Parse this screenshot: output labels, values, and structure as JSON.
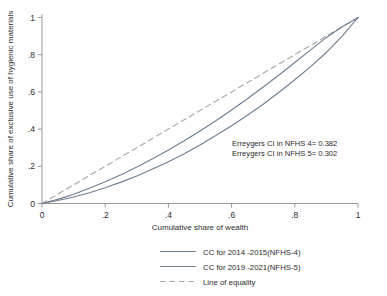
{
  "chart_data": {
    "type": "line",
    "title": "",
    "xlabel": "Cumulative share of wealth",
    "ylabel": "Cumulative share of exclusive use of hygienic materials",
    "xlim": [
      0,
      1
    ],
    "ylim": [
      0,
      1
    ],
    "grid": false,
    "legend_position": "bottom-center",
    "xticks": [
      "0",
      ".2",
      ".4",
      ".6",
      ".8",
      "1"
    ],
    "xtick_values": [
      0,
      0.2,
      0.4,
      0.6,
      0.8,
      1
    ],
    "yticks": [
      "0",
      ".2",
      ".4",
      ".6",
      ".8",
      "1"
    ],
    "ytick_values": [
      0,
      0.2,
      0.4,
      0.6,
      0.8,
      1
    ],
    "x": [
      0,
      0.05,
      0.1,
      0.15,
      0.2,
      0.25,
      0.3,
      0.35,
      0.4,
      0.45,
      0.5,
      0.55,
      0.6,
      0.65,
      0.7,
      0.75,
      0.8,
      0.85,
      0.9,
      0.95,
      1
    ],
    "series": [
      {
        "name": "CC for 2014 -2015(NFHS-4)",
        "style": "solid",
        "color": "#6f7f91",
        "values": [
          0,
          0.016,
          0.035,
          0.058,
          0.085,
          0.115,
          0.148,
          0.185,
          0.225,
          0.268,
          0.315,
          0.365,
          0.418,
          0.474,
          0.534,
          0.598,
          0.665,
          0.736,
          0.812,
          0.9,
          1
        ]
      },
      {
        "name": "CC for 2019 -2021(NFHS-5)",
        "style": "solid",
        "color": "#6f7f91",
        "values": [
          0,
          0.022,
          0.05,
          0.082,
          0.117,
          0.155,
          0.196,
          0.24,
          0.287,
          0.337,
          0.39,
          0.445,
          0.503,
          0.563,
          0.626,
          0.691,
          0.758,
          0.826,
          0.893,
          0.95,
          1
        ]
      },
      {
        "name": "Line of equality",
        "style": "dashed",
        "color": "#a9a9a9",
        "values": [
          0,
          0.05,
          0.1,
          0.15,
          0.2,
          0.25,
          0.3,
          0.35,
          0.4,
          0.45,
          0.5,
          0.55,
          0.6,
          0.65,
          0.7,
          0.75,
          0.8,
          0.85,
          0.9,
          0.95,
          1
        ]
      }
    ],
    "annotations": [
      "Erreygers CI in NFHS 4= 0.382",
      "Erreygers CI in NFHS 5= 0.302"
    ]
  },
  "annotation_block": {
    "line1": "Erreygers CI in NFHS 4= 0.382",
    "line2": "Erreygers CI in NFHS 5= 0.302"
  },
  "axes": {
    "x_title": "Cumulative share of wealth",
    "y_title": "Cumulative share of exclusive use of hygienic materials",
    "x_tick_0": "0",
    "x_tick_1": ".2",
    "x_tick_2": ".4",
    "x_tick_3": ".6",
    "x_tick_4": ".8",
    "x_tick_5": "1",
    "y_tick_0": "0",
    "y_tick_1": ".2",
    "y_tick_2": ".4",
    "y_tick_3": ".6",
    "y_tick_4": ".8",
    "y_tick_5": "1"
  },
  "legend": {
    "item_0_label": "CC for 2014 -2015(NFHS-4)",
    "item_1_label": "CC for 2019 -2021(NFHS-5)",
    "item_2_label": "Line of equality"
  },
  "colors": {
    "series_solid": "#6f7f91",
    "series_dashed": "#a9a9a9",
    "axis": "#8a8a8a",
    "text": "#2b2b2b",
    "background": "#ffffff"
  }
}
